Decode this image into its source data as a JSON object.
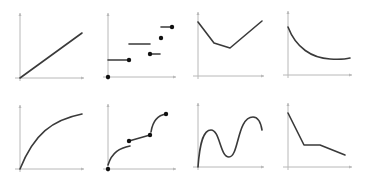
{
  "chart_data": [
    {
      "id": "linear",
      "type": "line",
      "title": "",
      "description": "Straight line through origin (linear increasing)",
      "axes": {
        "origin": [
          20,
          78
        ],
        "x_end": 84,
        "y_end": 13
      },
      "points": [
        [
          20,
          78
        ],
        [
          82,
          33
        ]
      ],
      "smooth": false,
      "dots": []
    },
    {
      "id": "step",
      "type": "line",
      "title": "",
      "description": "Piecewise step function with discontinuities",
      "axes": {
        "origin": [
          108,
          77
        ],
        "x_end": 176,
        "y_end": 13
      },
      "segments": [
        [
          [
            108,
            60
          ],
          [
            129,
            60
          ]
        ],
        [
          [
            129,
            44
          ],
          [
            150,
            44
          ]
        ],
        [
          [
            150,
            54
          ],
          [
            160,
            54
          ]
        ],
        [
          [
            161,
            27
          ],
          [
            172,
            27
          ]
        ]
      ],
      "dots": [
        [
          108,
          77
        ],
        [
          129,
          60
        ],
        [
          150,
          54
        ],
        [
          161,
          38
        ],
        [
          172,
          27
        ]
      ]
    },
    {
      "id": "v-shape",
      "type": "line",
      "title": "",
      "description": "Piecewise linear decreasing then increasing",
      "axes": {
        "origin": [
          198,
          76
        ],
        "x_end": 264,
        "y_end": 12
      },
      "points": [
        [
          198,
          22
        ],
        [
          214,
          43
        ],
        [
          230,
          48
        ],
        [
          262,
          21
        ]
      ],
      "smooth": false,
      "dots": []
    },
    {
      "id": "decay",
      "type": "line",
      "title": "",
      "description": "Exponential-like decay curve",
      "axes": {
        "origin": [
          288,
          75
        ],
        "x_end": 352,
        "y_end": 11
      },
      "path": "M288,27 C296,48 312,58 330,59 C340,59.5 346,59 350,58",
      "dots": []
    },
    {
      "id": "concave",
      "type": "line",
      "title": "",
      "description": "Concave increasing (logarithmic-like) curve from origin",
      "axes": {
        "origin": [
          20,
          169
        ],
        "x_end": 84,
        "y_end": 105
      },
      "path": "M20,169 C34,134 52,120 82,114",
      "dots": []
    },
    {
      "id": "piecewise-curve",
      "type": "line",
      "title": "",
      "description": "Piecewise increasing curves with jump discontinuities",
      "axes": {
        "origin": [
          108,
          169
        ],
        "x_end": 176,
        "y_end": 104
      },
      "paths": [
        "M108,165 C112,152 120,148 130,146",
        "M129,141 L150,135",
        "M151,132 C153,119 159,115 166,114"
      ],
      "dots": [
        [
          108,
          169
        ],
        [
          129,
          141
        ],
        [
          150,
          135
        ],
        [
          166,
          114
        ]
      ]
    },
    {
      "id": "wave",
      "type": "line",
      "title": "",
      "description": "Oscillating wave curve",
      "axes": {
        "origin": [
          198,
          167
        ],
        "x_end": 264,
        "y_end": 103
      },
      "path": "M198,167 C200,140 204,130 211,130 C220,130 220,157 229,157 C239,157 237,117 253,117 C259,117 261,124 262,130",
      "dots": []
    },
    {
      "id": "decreasing-plateau",
      "type": "line",
      "title": "",
      "description": "Piecewise linear decreasing with a flat plateau",
      "axes": {
        "origin": [
          288,
          167
        ],
        "x_end": 352,
        "y_end": 103
      },
      "points": [
        [
          288,
          113
        ],
        [
          304,
          145
        ],
        [
          320,
          145
        ],
        [
          345,
          155
        ]
      ],
      "smooth": false,
      "dots": []
    }
  ],
  "colors": {
    "axis": "#b8b8b8",
    "line": "#3a3a3a",
    "dot": "#111111",
    "background": "#ffffff"
  }
}
